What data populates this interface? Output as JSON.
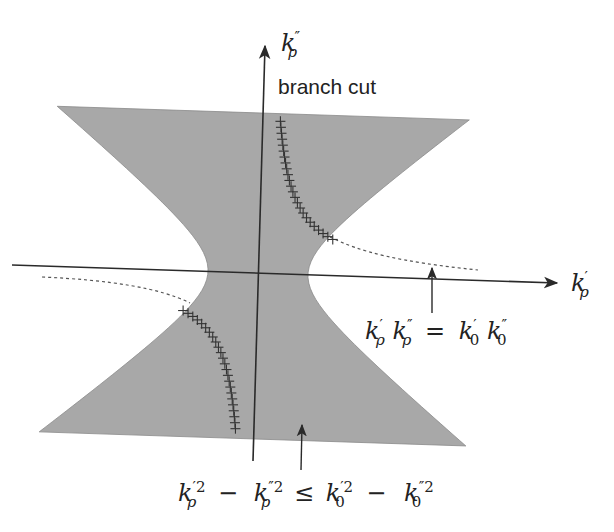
{
  "figure": {
    "type": "complex-plane region diagram",
    "colors": {
      "shaded_region": "#a8a8a8",
      "axes": "#2a2a2a",
      "branch_cut_marks": "#333333",
      "dashed_curve": "#555555",
      "background": "#ffffff"
    },
    "axes": {
      "horizontal": {
        "symbol": "k",
        "prime": "′",
        "subscript": "ρ"
      },
      "vertical": {
        "symbol": "k",
        "prime": "″",
        "subscript": "ρ"
      }
    },
    "labels": {
      "branch_cut": "branch cut",
      "hyperbola_equation": {
        "lhs_1": "k",
        "lhs_1_prime": "′",
        "lhs_1_sub": "ρ",
        "lhs_2": "k",
        "lhs_2_prime": "″",
        "lhs_2_sub": "ρ",
        "eq": "=",
        "rhs_1": "k",
        "rhs_1_prime": "′",
        "rhs_1_sub": "0",
        "rhs_2": "k",
        "rhs_2_prime": "″",
        "rhs_2_sub": "0"
      },
      "region_inequality": {
        "t1": "k",
        "t1_sup": "′2",
        "t1_sub": "ρ",
        "minus1": "−",
        "t2": "k",
        "t2_sup": "″2",
        "t2_sub": "ρ",
        "leq": "≤",
        "t3": "k",
        "t3_sup": "′2",
        "t3_sub": "0",
        "minus2": "−",
        "t4": "k",
        "t4_sup": "″2",
        "t4_sub": "0"
      }
    },
    "annotations": [
      {
        "name": "branch-cut",
        "description": "crosses along hyperbola branch in quadrants I and III inside shaded region"
      },
      {
        "name": "dashed-continuation",
        "description": "dashed hyperbola continuation outside shaded region"
      },
      {
        "name": "arrow-to-dashed-curve",
        "points_to": "k'ρ k''ρ = k'0 k''0"
      },
      {
        "name": "arrow-to-shaded-region",
        "points_to": "k'ρ² − k''ρ² ≤ k'0² − k''0²"
      }
    ]
  }
}
